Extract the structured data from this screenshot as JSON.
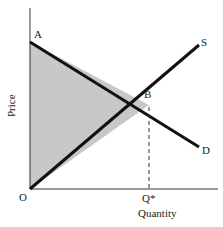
{
  "diagram": {
    "type": "supply-demand",
    "axes": {
      "y_label": "Price",
      "x_label": "Quantity",
      "origin_label": "O"
    },
    "points": {
      "A": "A",
      "B": "B",
      "q_star": "Q*"
    },
    "curves": {
      "supply_label": "S",
      "demand_label": "D"
    },
    "shaded_region": "triangle A-B-O",
    "colors": {
      "line": "#111111",
      "shade": "#c8c8c8",
      "axis": "#333333"
    }
  }
}
